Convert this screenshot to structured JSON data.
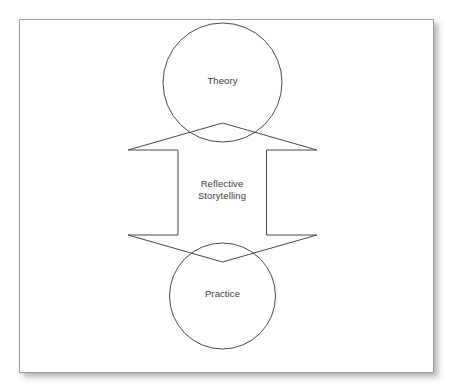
{
  "figure": {
    "frame": {
      "border_color": "#9a9a9a",
      "background_color": "#ffffff",
      "shadow_color": "#5a5a5a"
    },
    "stroke_color": "#4a4a4a",
    "text_color": "#3b3b3b"
  },
  "nodes": {
    "top_circle": {
      "label": "Theory",
      "shape": "circle"
    },
    "bottom_circle": {
      "label": "Practice",
      "shape": "circle"
    },
    "center": {
      "label": "Reflective\nStorytelling",
      "line_1": "Reflective",
      "line_2": "Storytelling"
    }
  },
  "connectors": {
    "up_arrow": {
      "name": "practice-to-theory-arrow",
      "direction": "up"
    },
    "down_arrow": {
      "name": "theory-to-practice-arrow",
      "direction": "down"
    }
  }
}
